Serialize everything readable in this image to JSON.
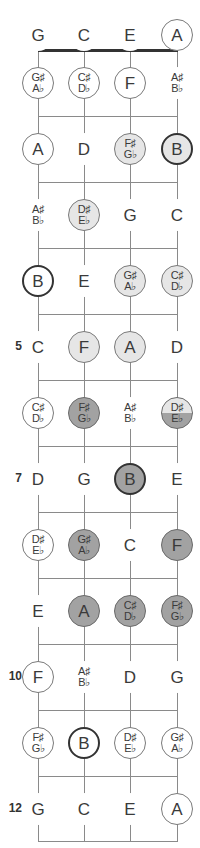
{
  "diagram": {
    "type": "ukulele-fretboard",
    "strings": [
      "G",
      "C",
      "E",
      "A"
    ],
    "string_x": [
      38,
      84,
      130,
      177
    ],
    "nut_y": 50,
    "fret_lines_y": [
      116,
      182,
      248,
      314,
      380,
      446,
      512,
      578,
      644,
      710,
      776,
      841
    ],
    "row_y": [
      35,
      83,
      149,
      215,
      281,
      347,
      413,
      479,
      545,
      611,
      677,
      743,
      809
    ],
    "colors": {
      "white": "#ffffff",
      "light": "#e6e6e6",
      "dark": "#a2a2a2",
      "line": "#8a8a8a",
      "nut": "#333333"
    },
    "fret_numbers": [
      {
        "fret": 5,
        "label": "5"
      },
      {
        "fret": 7,
        "label": "7"
      },
      {
        "fret": 10,
        "label": "10"
      },
      {
        "fret": 12,
        "label": "12"
      }
    ],
    "rows": [
      {
        "fret": 0,
        "notes": [
          {
            "top": "G",
            "style": "plain"
          },
          {
            "top": "C",
            "style": "plain"
          },
          {
            "top": "E",
            "style": "plain"
          },
          {
            "top": "A",
            "style": "white"
          }
        ]
      },
      {
        "fret": 1,
        "notes": [
          {
            "top": "G♯",
            "bottom": "A♭",
            "style": "white"
          },
          {
            "top": "C♯",
            "bottom": "D♭",
            "style": "white"
          },
          {
            "top": "F",
            "style": "white"
          },
          {
            "top": "A♯",
            "bottom": "B♭",
            "style": "plain"
          }
        ]
      },
      {
        "fret": 2,
        "notes": [
          {
            "top": "A",
            "style": "white"
          },
          {
            "top": "D",
            "style": "plain"
          },
          {
            "top": "F♯",
            "bottom": "G♭",
            "style": "light"
          },
          {
            "top": "B",
            "style": "light",
            "thick": true
          }
        ]
      },
      {
        "fret": 3,
        "notes": [
          {
            "top": "A♯",
            "bottom": "B♭",
            "style": "plain"
          },
          {
            "top": "D♯",
            "bottom": "E♭",
            "style": "light"
          },
          {
            "top": "G",
            "style": "plain"
          },
          {
            "top": "C",
            "style": "plain"
          }
        ]
      },
      {
        "fret": 4,
        "notes": [
          {
            "top": "B",
            "style": "white",
            "thick": true
          },
          {
            "top": "E",
            "style": "plain"
          },
          {
            "top": "G♯",
            "bottom": "A♭",
            "style": "light"
          },
          {
            "top": "C♯",
            "bottom": "D♭",
            "style": "light"
          }
        ]
      },
      {
        "fret": 5,
        "notes": [
          {
            "top": "C",
            "style": "plain"
          },
          {
            "top": "F",
            "style": "light"
          },
          {
            "top": "A",
            "style": "light"
          },
          {
            "top": "D",
            "style": "plain"
          }
        ]
      },
      {
        "fret": 6,
        "notes": [
          {
            "top": "C♯",
            "bottom": "D♭",
            "style": "white"
          },
          {
            "top": "F♯",
            "bottom": "G♭",
            "style": "dark"
          },
          {
            "top": "A♯",
            "bottom": "B♭",
            "style": "plain"
          },
          {
            "top": "D♯",
            "bottom": "E♭",
            "style": "half"
          }
        ]
      },
      {
        "fret": 7,
        "notes": [
          {
            "top": "D",
            "style": "plain"
          },
          {
            "top": "G",
            "style": "plain"
          },
          {
            "top": "B",
            "style": "dark",
            "thick": true
          },
          {
            "top": "E",
            "style": "plain"
          }
        ]
      },
      {
        "fret": 8,
        "notes": [
          {
            "top": "D♯",
            "bottom": "E♭",
            "style": "white"
          },
          {
            "top": "G♯",
            "bottom": "A♭",
            "style": "dark"
          },
          {
            "top": "C",
            "style": "plain"
          },
          {
            "top": "F",
            "style": "dark"
          }
        ]
      },
      {
        "fret": 9,
        "notes": [
          {
            "top": "E",
            "style": "plain"
          },
          {
            "top": "A",
            "style": "dark"
          },
          {
            "top": "C♯",
            "bottom": "D♭",
            "style": "dark"
          },
          {
            "top": "F♯",
            "bottom": "G♭",
            "style": "dark"
          }
        ]
      },
      {
        "fret": 10,
        "notes": [
          {
            "top": "F",
            "style": "white"
          },
          {
            "top": "A♯",
            "bottom": "B♭",
            "style": "plain"
          },
          {
            "top": "D",
            "style": "plain"
          },
          {
            "top": "G",
            "style": "plain"
          }
        ]
      },
      {
        "fret": 11,
        "notes": [
          {
            "top": "F♯",
            "bottom": "G♭",
            "style": "white"
          },
          {
            "top": "B",
            "style": "white",
            "thick": true
          },
          {
            "top": "D♯",
            "bottom": "E♭",
            "style": "white"
          },
          {
            "top": "G♯",
            "bottom": "A♭",
            "style": "white"
          }
        ]
      },
      {
        "fret": 12,
        "notes": [
          {
            "top": "G",
            "style": "plain"
          },
          {
            "top": "C",
            "style": "plain"
          },
          {
            "top": "E",
            "style": "plain"
          },
          {
            "top": "A",
            "style": "white"
          }
        ]
      }
    ]
  }
}
